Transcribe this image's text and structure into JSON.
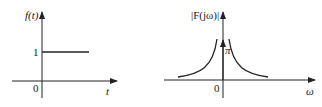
{
  "left_plot": {
    "y_label": "f(t)",
    "x_label": "t",
    "origin_label": "0",
    "level_label": "1"
  },
  "right_plot": {
    "y_label": "|F(jω)|",
    "x_label": "ω",
    "origin_label": "0",
    "impulse_label": "π"
  },
  "colors": {
    "stroke": "#222222"
  }
}
